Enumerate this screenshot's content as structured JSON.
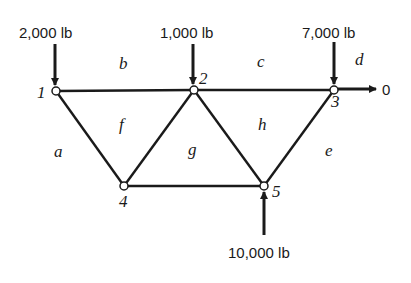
{
  "diagram": {
    "type": "truss",
    "nodes": [
      {
        "id": "1",
        "label": "1",
        "x": 56,
        "y": 91
      },
      {
        "id": "2",
        "label": "2",
        "x": 194,
        "y": 90
      },
      {
        "id": "3",
        "label": "3",
        "x": 334,
        "y": 90
      },
      {
        "id": "4",
        "label": "4",
        "x": 124,
        "y": 186
      },
      {
        "id": "5",
        "label": "5",
        "x": 264,
        "y": 186
      }
    ],
    "members": [
      [
        "1",
        "2"
      ],
      [
        "2",
        "3"
      ],
      [
        "1",
        "4"
      ],
      [
        "4",
        "2"
      ],
      [
        "2",
        "5"
      ],
      [
        "5",
        "3"
      ],
      [
        "4",
        "5"
      ]
    ],
    "loads": [
      {
        "node": "1",
        "label": "2,000 lb",
        "direction": "down"
      },
      {
        "node": "2",
        "label": "1,000 lb",
        "direction": "down"
      },
      {
        "node": "3",
        "label": "7,000 lb",
        "direction": "down"
      },
      {
        "node": "5",
        "label": "10,000 lb",
        "direction": "up"
      },
      {
        "node": "3",
        "label": "0",
        "direction": "right"
      }
    ],
    "regions": [
      "a",
      "b",
      "c",
      "d",
      "e",
      "f",
      "g",
      "h"
    ]
  }
}
